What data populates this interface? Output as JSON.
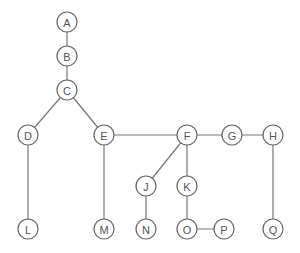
{
  "diagram": {
    "type": "tree-graph",
    "colors": {
      "node_stroke": "#666666",
      "edge": "#777777",
      "label": "#555555",
      "background": "#ffffff"
    },
    "node_radius": 10,
    "nodes": [
      {
        "id": "A",
        "label": "A",
        "x": 67,
        "y": 22
      },
      {
        "id": "B",
        "label": "B",
        "x": 67,
        "y": 56
      },
      {
        "id": "C",
        "label": "C",
        "x": 67,
        "y": 90
      },
      {
        "id": "D",
        "label": "D",
        "x": 28,
        "y": 135
      },
      {
        "id": "E",
        "label": "E",
        "x": 104,
        "y": 135
      },
      {
        "id": "F",
        "label": "F",
        "x": 187,
        "y": 135
      },
      {
        "id": "G",
        "label": "G",
        "x": 232,
        "y": 135
      },
      {
        "id": "H",
        "label": "H",
        "x": 273,
        "y": 135
      },
      {
        "id": "J",
        "label": "J",
        "x": 146,
        "y": 186
      },
      {
        "id": "K",
        "label": "K",
        "x": 187,
        "y": 186
      },
      {
        "id": "L",
        "label": "L",
        "x": 28,
        "y": 229
      },
      {
        "id": "M",
        "label": "M",
        "x": 104,
        "y": 229
      },
      {
        "id": "N",
        "label": "N",
        "x": 146,
        "y": 229
      },
      {
        "id": "O",
        "label": "O",
        "x": 187,
        "y": 229
      },
      {
        "id": "P",
        "label": "P",
        "x": 224,
        "y": 229
      },
      {
        "id": "Q",
        "label": "Q",
        "x": 273,
        "y": 229
      }
    ],
    "edges": [
      [
        "A",
        "B"
      ],
      [
        "B",
        "C"
      ],
      [
        "C",
        "D"
      ],
      [
        "C",
        "E"
      ],
      [
        "D",
        "L"
      ],
      [
        "E",
        "M"
      ],
      [
        "E",
        "F"
      ],
      [
        "F",
        "G"
      ],
      [
        "G",
        "H"
      ],
      [
        "F",
        "J"
      ],
      [
        "F",
        "K"
      ],
      [
        "J",
        "N"
      ],
      [
        "K",
        "O"
      ],
      [
        "O",
        "P"
      ],
      [
        "H",
        "Q"
      ]
    ]
  }
}
